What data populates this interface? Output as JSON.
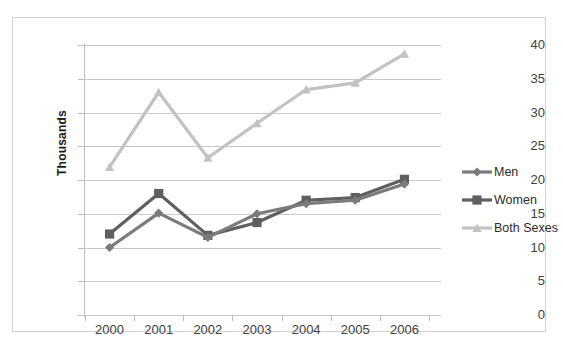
{
  "top_sliver_text": " ",
  "colors": {
    "men": "#7b7b7b",
    "women": "#5f5f5f",
    "both_sexes": "#c2c2c2",
    "gridline": "#c8c8c8",
    "axis": "#bdbdbd",
    "frame": "#d2d2d4",
    "text": "#404040"
  },
  "axes": {
    "y_title": "Thousands",
    "y_ticks": [
      "40",
      "35",
      "30",
      "25",
      "20",
      "15",
      "10",
      "5",
      "0"
    ],
    "x_ticks": [
      "2000",
      "2001",
      "2002",
      "2003",
      "2004",
      "2005",
      "2006"
    ]
  },
  "legend": {
    "items": [
      {
        "label": "Men",
        "marker": "diamond-marker",
        "color": "#7b7b7b"
      },
      {
        "label": "Women",
        "marker": "square-marker",
        "color": "#5f5f5f"
      },
      {
        "label": "Both Sexes",
        "marker": "triangle-marker",
        "color": "#c2c2c2"
      }
    ]
  },
  "chart_data": {
    "type": "line",
    "title": "",
    "xlabel": "",
    "ylabel": "Thousands",
    "categories": [
      "2000",
      "2001",
      "2002",
      "2003",
      "2004",
      "2005",
      "2006"
    ],
    "ylim": [
      0,
      40
    ],
    "ytick_step": 5,
    "grid": true,
    "legend_position": "right",
    "series": [
      {
        "name": "Men",
        "marker": "diamond",
        "color": "#7b7b7b",
        "values": [
          10.0,
          15.1,
          11.5,
          15.0,
          16.5,
          17.0,
          19.4
        ]
      },
      {
        "name": "Women",
        "marker": "square",
        "color": "#5f5f5f",
        "values": [
          12.0,
          18.0,
          11.8,
          13.7,
          17.0,
          17.4,
          20.1
        ]
      },
      {
        "name": "Both Sexes",
        "marker": "triangle",
        "color": "#c2c2c2",
        "values": [
          21.9,
          33.0,
          23.3,
          28.4,
          33.4,
          34.4,
          38.7
        ]
      }
    ]
  }
}
